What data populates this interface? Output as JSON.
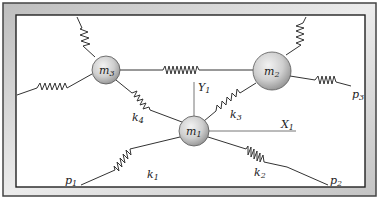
{
  "diagram": {
    "type": "spring-mass system",
    "masses": [
      {
        "id": "m1",
        "label": "m",
        "sub": "1",
        "x": 194,
        "y": 131,
        "r": 15
      },
      {
        "id": "m2",
        "label": "m",
        "sub": "2",
        "x": 272,
        "y": 71,
        "r": 19
      },
      {
        "id": "m3",
        "label": "m",
        "sub": "3",
        "x": 106,
        "y": 70,
        "r": 14
      }
    ],
    "springs": [
      {
        "label": "k",
        "sub": "1",
        "lx": 150,
        "ly": 176
      },
      {
        "label": "k",
        "sub": "2",
        "lx": 257,
        "ly": 173
      },
      {
        "label": "k",
        "sub": "3",
        "lx": 232,
        "ly": 116
      },
      {
        "label": "k",
        "sub": "4",
        "lx": 134,
        "ly": 119
      }
    ],
    "points": [
      {
        "label": "p",
        "sub": "1",
        "lx": 67,
        "ly": 182
      },
      {
        "label": "p",
        "sub": "2",
        "lx": 331,
        "ly": 182
      },
      {
        "label": "p",
        "sub": "3",
        "lx": 353,
        "ly": 96
      }
    ],
    "axes": [
      {
        "label": "X",
        "sub": "1",
        "lx": 283,
        "ly": 130
      },
      {
        "label": "Y",
        "sub": "1",
        "lx": 200,
        "ly": 90
      }
    ],
    "colors": {
      "frame_outer": "#d8d8d8",
      "frame_line": "#333333",
      "mass_fill": "#d4d4d4",
      "spring": "#333333",
      "axis": "#666666"
    }
  }
}
